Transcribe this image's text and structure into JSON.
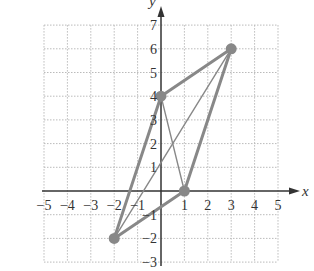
{
  "chart_data": {
    "type": "scatter",
    "title": "",
    "xlabel": "x",
    "ylabel": "y",
    "xlim": [
      -5,
      5
    ],
    "ylim": [
      -3,
      7
    ],
    "grid": true,
    "x_ticks": [
      -5,
      -4,
      -3,
      -2,
      -1,
      1,
      2,
      3,
      4,
      5
    ],
    "y_ticks": [
      -3,
      -2,
      -1,
      1,
      2,
      3,
      4,
      5,
      6,
      7
    ],
    "points": [
      {
        "x": 3,
        "y": 6
      },
      {
        "x": 0,
        "y": 4
      },
      {
        "x": 1,
        "y": 0
      },
      {
        "x": -2,
        "y": -2
      }
    ],
    "edges": [
      {
        "from": [
          -2,
          -2
        ],
        "to": [
          0,
          4
        ],
        "style": "thick"
      },
      {
        "from": [
          0,
          4
        ],
        "to": [
          3,
          6
        ],
        "style": "thick"
      },
      {
        "from": [
          3,
          6
        ],
        "to": [
          1,
          0
        ],
        "style": "thick"
      },
      {
        "from": [
          1,
          0
        ],
        "to": [
          -2,
          -2
        ],
        "style": "thick"
      },
      {
        "from": [
          0,
          4
        ],
        "to": [
          1,
          0
        ],
        "style": "thin"
      },
      {
        "from": [
          -2,
          -2
        ],
        "to": [
          3,
          6
        ],
        "style": "thin"
      }
    ],
    "colors": {
      "axis": "#333333",
      "grid": "#bbbbbb",
      "shape": "#888888",
      "point": "#888888"
    }
  }
}
